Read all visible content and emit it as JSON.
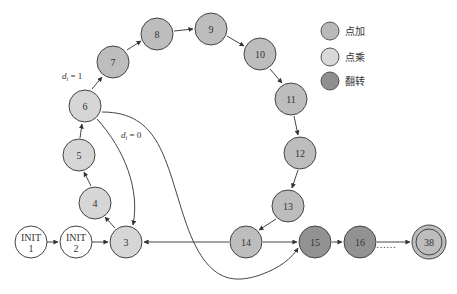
{
  "legend": {
    "items": [
      {
        "label": "点加",
        "color": "#b9b9b9"
      },
      {
        "label": "点乘",
        "color": "#d9d9d9"
      },
      {
        "label": "翻转",
        "color": "#8f8f8f"
      }
    ]
  },
  "nodes": [
    {
      "id": "INIT1",
      "line1": "INIT",
      "line2": "1",
      "x": 31,
      "y": 242,
      "type": "init"
    },
    {
      "id": "INIT2",
      "line1": "INIT",
      "line2": "2",
      "x": 76,
      "y": 242,
      "type": "init"
    },
    {
      "id": "3",
      "label": "3",
      "x": 126,
      "y": 242,
      "type": "mul"
    },
    {
      "id": "4",
      "label": "4",
      "x": 95,
      "y": 203,
      "type": "mul"
    },
    {
      "id": "5",
      "label": "5",
      "x": 79,
      "y": 155,
      "type": "mul"
    },
    {
      "id": "6",
      "label": "6",
      "x": 85,
      "y": 106,
      "type": "mul"
    },
    {
      "id": "7",
      "label": "7",
      "x": 113,
      "y": 62,
      "type": "add"
    },
    {
      "id": "8",
      "label": "8",
      "x": 157,
      "y": 34,
      "type": "add"
    },
    {
      "id": "9",
      "label": "9",
      "x": 211,
      "y": 29,
      "type": "add"
    },
    {
      "id": "10",
      "label": "10",
      "x": 260,
      "y": 54,
      "type": "add"
    },
    {
      "id": "11",
      "label": "11",
      "x": 291,
      "y": 99,
      "type": "add"
    },
    {
      "id": "12",
      "label": "12",
      "x": 300,
      "y": 153,
      "type": "add"
    },
    {
      "id": "13",
      "label": "13",
      "x": 288,
      "y": 206,
      "type": "add"
    },
    {
      "id": "14",
      "label": "14",
      "x": 246,
      "y": 242,
      "type": "add"
    },
    {
      "id": "15",
      "label": "15",
      "x": 315,
      "y": 242,
      "type": "flip"
    },
    {
      "id": "16",
      "label": "16",
      "x": 360,
      "y": 242,
      "type": "flip"
    },
    {
      "id": "38",
      "label": "38",
      "x": 429,
      "y": 242,
      "type": "final"
    }
  ],
  "annotations": {
    "d1_label": "d",
    "d1_sub": "i",
    "d1_value": " = 1",
    "d0_label": "d",
    "d0_sub": "i",
    "d0_value": " = 0"
  },
  "ellipsis": "……"
}
